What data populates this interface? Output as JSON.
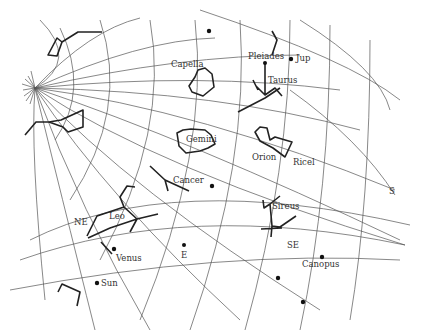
{
  "labels": {
    "capella": "Capella",
    "pleiades": "Pleiades",
    "jup": "Jup",
    "taurus": "Taurus",
    "gemini": "Gemini",
    "orion": "Orion",
    "ricel": "Ricel",
    "cancer": "Cancer",
    "sireus": "Sireus",
    "leo": "Leo",
    "ne": "NE",
    "venus": "Venus",
    "e": "E",
    "se": "SE",
    "s": "S",
    "canopus": "Canopus",
    "sun": "Sun"
  },
  "colors": {
    "ink": "#222222",
    "grid": "#555555",
    "background": "#ffffff"
  }
}
